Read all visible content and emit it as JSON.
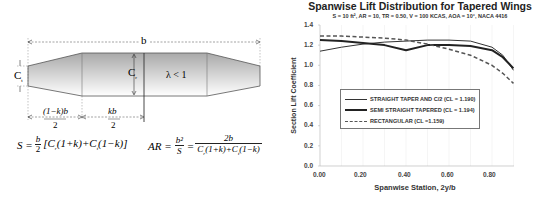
{
  "diagram": {
    "span_label": "b",
    "tip_chord_label": "C",
    "tip_chord_sub": "t",
    "root_chord_label": "C",
    "root_chord_sub": "r",
    "taper_label": "λ < 1",
    "dim_left_num": "(1−k)b",
    "dim_left_den": "2",
    "dim_mid_num": "kb",
    "dim_mid_den": "2",
    "area_formula": "S = b/2 [C_r(1+k) + C_t(1−k)]",
    "ar_formula": "AR = b²/S = 2b / (C_r(1+k) + C_t(1−k))"
  },
  "chart_data": {
    "type": "line",
    "title": "Spanwise Lift Distribution for  Tapered Wings",
    "subtitle": "S = 10 ft², AR = 10, TR = 0.50, V = 100 KCAS, AOA = 10°, NACA 4416",
    "xlabel": "Spanwise Station, 2y/b",
    "ylabel": "Section Lift Coefficient",
    "xlim": [
      0,
      0.9
    ],
    "ylim": [
      0,
      1.4
    ],
    "xticks": [
      "0.00",
      "0.20",
      "0.40",
      "0.60",
      "0.80"
    ],
    "yticks": [
      "0.0",
      "0.2",
      "0.4",
      "0.6",
      "0.8",
      "1.0",
      "1.2",
      "1.4"
    ],
    "grid": "vertical-light",
    "legend_position": "center-left inside plot",
    "x": [
      0.0,
      0.1,
      0.2,
      0.3,
      0.4,
      0.5,
      0.6,
      0.7,
      0.8,
      0.85,
      0.9
    ],
    "series": [
      {
        "name": "STRAIGHT TAPER AND C/2 (CL = 1.190)",
        "style": "thin-solid",
        "values": [
          1.14,
          1.18,
          1.21,
          1.23,
          1.24,
          1.25,
          1.25,
          1.24,
          1.18,
          1.1,
          0.95
        ]
      },
      {
        "name": "SEMI STRAIGHT  TAPERED (CL = 1.194)",
        "style": "thick-solid",
        "values": [
          1.25,
          1.24,
          1.22,
          1.2,
          1.15,
          1.2,
          1.2,
          1.19,
          1.15,
          1.08,
          0.97
        ]
      },
      {
        "name": "RECTANGULAR (CL =1.159)",
        "style": "dashed",
        "values": [
          1.29,
          1.29,
          1.28,
          1.27,
          1.25,
          1.21,
          1.16,
          1.1,
          1.0,
          0.92,
          0.82
        ]
      }
    ]
  }
}
